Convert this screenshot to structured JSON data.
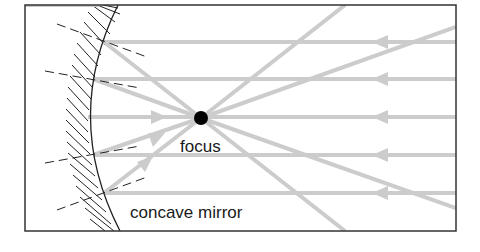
{
  "diagram": {
    "labels": {
      "focus": "focus",
      "mirror": "concave mirror"
    },
    "colors": {
      "frame": "#333333",
      "ray": "#cccccc",
      "mirror": "#222222",
      "normal": "#222222",
      "focus_dot": "#000000",
      "background": "#ffffff"
    },
    "frame": {
      "x": 25,
      "y": 5,
      "width": 431,
      "height": 226
    },
    "focus_point": {
      "x": 201,
      "y": 118,
      "r": 7
    },
    "incident_rays_y": [
      42,
      79,
      117,
      155,
      193
    ],
    "ray_arrow_x": 385
  }
}
